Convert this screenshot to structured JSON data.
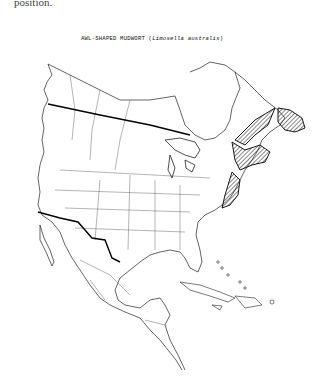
{
  "page": {
    "fragment_text": "position."
  },
  "map": {
    "title_common": "AWL-SHAPED MUDWORT",
    "title_open_paren": "(",
    "title_scientific": "Limosella australis",
    "title_close_paren": ")",
    "region": "North America",
    "distribution_style": "hatched",
    "distribution_regions": [
      "Newfoundland",
      "Gulf of St. Lawrence coast",
      "Nova Scotia / New Brunswick",
      "Atlantic coast south to Virginia/North Carolina"
    ],
    "colors": {
      "line": "#222222",
      "border_thick": "#000000",
      "background": "#ffffff"
    }
  }
}
